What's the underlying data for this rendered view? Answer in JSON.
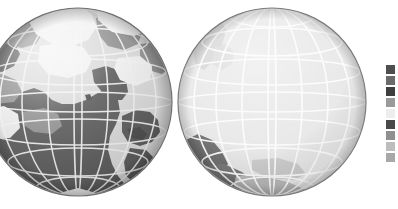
{
  "figure": {
    "type": "orthographic-globe-pair",
    "background_color": "#ffffff",
    "width": 398,
    "height": 209
  },
  "globes": [
    {
      "id": "globe-left",
      "name": "left-globe",
      "center_x": 78,
      "center_y": 102,
      "radius": 94,
      "clipped_at_left_edge": true,
      "ocean_color": "#d9d9d9",
      "outline_color": "#6e6e6e",
      "graticule_color": "#f2f2f2",
      "graticule_meridian_count": 12,
      "graticule_parallel_count": 6,
      "pole_visible": "south",
      "shading": "terminator-bright-upper-left",
      "regions": [
        {
          "name": "dark-landmass-central",
          "fill": "#5a5a5a",
          "label": "dark region"
        },
        {
          "name": "mid-landmass",
          "fill": "#8f8f8f",
          "label": "mid-tone region"
        },
        {
          "name": "light-landmass",
          "fill": "#f0f0f0",
          "label": "light region"
        }
      ]
    },
    {
      "id": "globe-right",
      "name": "right-globe",
      "center_x": 272,
      "center_y": 102,
      "radius": 94,
      "clipped_at_left_edge": false,
      "ocean_color": "#e4e4e4",
      "outline_color": "#7a7a7a",
      "graticule_color": "#fbfbfb",
      "graticule_meridian_count": 12,
      "graticule_parallel_count": 6,
      "pole_visible": "south",
      "shading": "mostly-uniform-light",
      "regions": [
        {
          "name": "dark-landmass-lower-left",
          "fill": "#5e5e5e",
          "label": "dark region"
        },
        {
          "name": "mid-landmass-upper-left",
          "fill": "#c9c9c9",
          "label": "mid-tone region"
        },
        {
          "name": "mid-landmass-lower",
          "fill": "#b2b2b2",
          "label": "mid-tone region"
        }
      ]
    }
  ],
  "legend": {
    "name": "color-scale-legend",
    "orientation": "vertical",
    "x": 385,
    "y": 64,
    "swatch_width": 11,
    "swatch_height": 11,
    "items": [
      {
        "index": 0,
        "color": "#4f4f4f",
        "label": ""
      },
      {
        "index": 1,
        "color": "#6b6b6b",
        "label": ""
      },
      {
        "index": 2,
        "color": "#3f3f3f",
        "label": ""
      },
      {
        "index": 3,
        "color": "#9a9a9a",
        "label": ""
      },
      {
        "index": 4,
        "color": "#ededed",
        "label": ""
      },
      {
        "index": 5,
        "color": "#4a4a4a",
        "label": ""
      },
      {
        "index": 6,
        "color": "#909090",
        "label": ""
      },
      {
        "index": 7,
        "color": "#bdbdbd",
        "label": ""
      },
      {
        "index": 8,
        "color": "#a8a8a8",
        "label": ""
      }
    ]
  }
}
